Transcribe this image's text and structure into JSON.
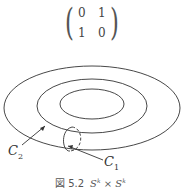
{
  "matrix": {
    "rows": [
      [
        "0",
        "1"
      ],
      [
        "1",
        "0"
      ]
    ]
  },
  "labels": {
    "c2": "C",
    "c2_sub": "2",
    "c1": "C",
    "c1_sub": "1"
  },
  "caption": {
    "prefix": "図 5.2",
    "math_base1": "S",
    "sup1": "k",
    "times": " × ",
    "math_base2": "S",
    "sup2": "k"
  }
}
